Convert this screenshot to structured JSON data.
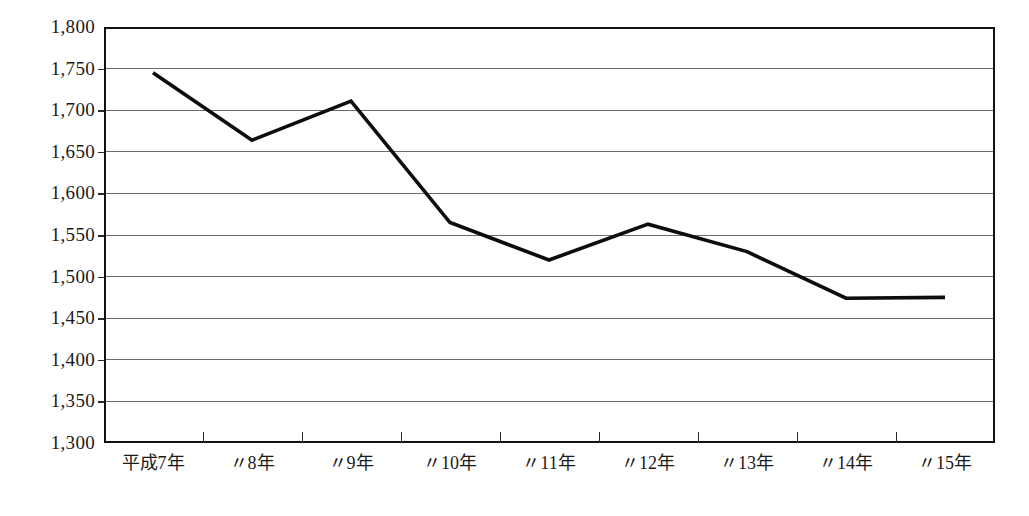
{
  "chart_data": {
    "type": "line",
    "title": "",
    "subtitle": "",
    "xlabel": "",
    "ylabel": "",
    "categories": [
      "平成7年",
      "〃8年",
      "〃9年",
      "〃10年",
      "〃11年",
      "〃12年",
      "〃13年",
      "〃14年",
      "〃15年"
    ],
    "values": [
      1745,
      1664,
      1711,
      1565,
      1520,
      1563,
      1530,
      1474,
      1475
    ],
    "series": [
      {
        "name": "",
        "values": [
          1745,
          1664,
          1711,
          1565,
          1520,
          1563,
          1530,
          1474,
          1475
        ]
      }
    ],
    "ylim": [
      1300,
      1800
    ],
    "ytick_step": 50,
    "yticks": [
      1800,
      1750,
      1700,
      1650,
      1600,
      1550,
      1500,
      1450,
      1400,
      1350,
      1300
    ],
    "ytick_labels": [
      "1,800",
      "1,750",
      "1,700",
      "1,650",
      "1,600",
      "1,550",
      "1,500",
      "1,450",
      "1,400",
      "1,350",
      "1,300"
    ],
    "grid": true,
    "grid_axis": "y",
    "legend": false,
    "legend_position": "none",
    "markers": false,
    "line_color": "#0d0d0d",
    "grid_color": "#6d6d6d",
    "frame_color": "#111111",
    "background_color": "#ffffff",
    "annotations": []
  },
  "axes": {
    "y": {
      "labels": [
        "1,800",
        "1,750",
        "1,700",
        "1,650",
        "1,600",
        "1,550",
        "1,500",
        "1,450",
        "1,400",
        "1,350",
        "1,300"
      ]
    },
    "x": {
      "labels": [
        "平成7年",
        "〃8年",
        "〃9年",
        "〃10年",
        "〃11年",
        "〃12年",
        "〃13年",
        "〃14年",
        "〃15年"
      ]
    }
  }
}
